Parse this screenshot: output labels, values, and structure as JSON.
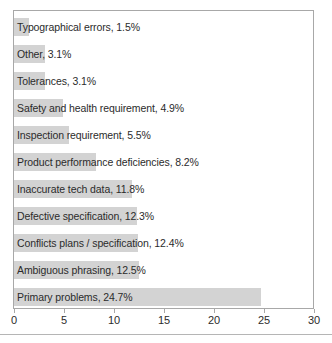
{
  "chart_data": {
    "type": "bar",
    "orientation": "horizontal",
    "title": "",
    "xlabel": "",
    "ylabel": "",
    "xlim": [
      0,
      30
    ],
    "xticks": [
      0,
      5,
      10,
      15,
      20,
      25,
      30
    ],
    "grid": false,
    "legend": null,
    "bar_color": "#d3d3d3",
    "frame_color": "#a8a8a8",
    "text_color": "#2b2b2b",
    "categories": [
      "Typographical errors",
      "Other",
      "Tolerances",
      "Safety and health requirement",
      "Inspection requirement",
      "Product performance deficiencies",
      "Inaccurate tech data",
      "Defective specification",
      "Conflicts plans / specification",
      "Ambiguous phrasing",
      "Primary problems"
    ],
    "values": [
      1.5,
      3.1,
      3.1,
      4.9,
      5.5,
      8.2,
      11.8,
      12.3,
      12.4,
      12.5,
      24.7
    ],
    "data_labels": [
      "Typographical errors, 1.5%",
      "Other, 3.1%",
      "Tolerances, 3.1%",
      "Safety and health requirement, 4.9%",
      "Inspection requirement, 5.5%",
      "Product performance deficiencies, 8.2%",
      "Inaccurate tech data, 11.8%",
      "Defective specification, 12.3%",
      "Conflicts plans / specification, 12.4%",
      "Ambiguous phrasing, 12.5%",
      "Primary problems, 24.7%"
    ]
  },
  "axis": {
    "tick_labels": [
      "0",
      "5",
      "10",
      "15",
      "20",
      "25",
      "30"
    ]
  }
}
